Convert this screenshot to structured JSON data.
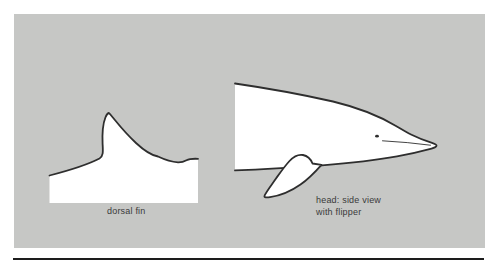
{
  "figure": {
    "labels": {
      "dorsal_fin": "dorsal fin",
      "head_view_line1": "head: side view",
      "head_view_line2": "with flipper"
    },
    "colors": {
      "page_background": "#ffffff",
      "panel_background": "#c6c7c5",
      "shape_fill": "#ffffff",
      "outline": "#2e2e2e",
      "label_text": "#3a3a3a",
      "bottom_rule": "#1d1d1d"
    }
  }
}
